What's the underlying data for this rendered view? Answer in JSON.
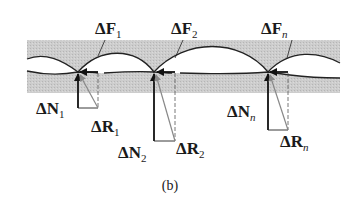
{
  "figure": {
    "caption": "(b)",
    "colors": {
      "band": "#c9c9c9",
      "line": "#222222",
      "arrow_resultant": "#888888"
    },
    "contacts": [
      {
        "id": "1",
        "friction_label": "ΔF",
        "friction_sub": "1",
        "normal_label": "ΔN",
        "normal_sub": "1",
        "resultant_label": "ΔR",
        "resultant_sub": "1"
      },
      {
        "id": "2",
        "friction_label": "ΔF",
        "friction_sub": "2",
        "normal_label": "ΔN",
        "normal_sub": "2",
        "resultant_label": "ΔR",
        "resultant_sub": "2"
      },
      {
        "id": "n",
        "friction_label": "ΔF",
        "friction_sub": "n",
        "normal_label": "ΔN",
        "normal_sub": "n",
        "resultant_label": "ΔR",
        "resultant_sub": "n"
      }
    ]
  }
}
